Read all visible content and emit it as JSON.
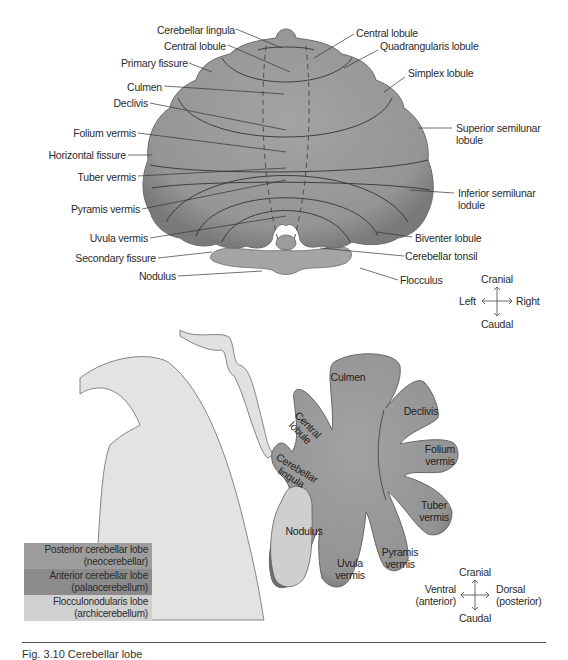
{
  "colors": {
    "cerebellum_fill": "#9a9a9a",
    "cerebellum_shade": "#7c7c7c",
    "brainstem_fill": "#e4e4e4",
    "outline": "#3a3a3a",
    "legend_posterior": "#9d9d9d",
    "legend_anterior": "#8a8a8a",
    "legend_flocculonodular": "#cfcfcf",
    "text": "#2b2b2b"
  },
  "top_view": {
    "labels_left": [
      {
        "text": "Cerebellar lingula"
      },
      {
        "text": "Central lobule"
      },
      {
        "text": "Primary fissure"
      },
      {
        "text": "Culmen"
      },
      {
        "text": "Declivis"
      },
      {
        "text": "Folium vermis"
      },
      {
        "text": "Horizontal fissure"
      },
      {
        "text": "Tuber vermis"
      },
      {
        "text": "Pyramis vermis"
      },
      {
        "text": "Uvula vermis"
      },
      {
        "text": "Secondary fissure"
      },
      {
        "text": "Nodulus"
      }
    ],
    "labels_right": [
      {
        "text": "Central lobule"
      },
      {
        "text": "Quadrangularis lobule"
      },
      {
        "text": "Simplex lobule"
      },
      {
        "text": "Superior semilunar",
        "text2": "lobule"
      },
      {
        "text": "Inferior semilunar",
        "text2": "lodule"
      },
      {
        "text": "Biventer lobule"
      },
      {
        "text": "Cerebellar tonsil"
      },
      {
        "text": "Flocculus"
      }
    ],
    "orientation": {
      "up": "Cranial",
      "down": "Caudal",
      "left": "Left",
      "right": "Right"
    }
  },
  "sagittal_view": {
    "lobes": {
      "culmen": "Culmen",
      "declivis": "Declivis",
      "central_lobule": "Central lobule",
      "cerebellar_lingula": "Cerebellar lingula",
      "folium_vermis_1": "Folium",
      "folium_vermis_2": "vermis",
      "tuber_vermis_1": "Tuber",
      "tuber_vermis_2": "vermis",
      "nodulus": "Nodulus",
      "uvula_vermis_1": "Uvula",
      "uvula_vermis_2": "vermis",
      "pyramis_vermis_1": "Pyramis",
      "pyramis_vermis_2": "vermis"
    },
    "orientation": {
      "up": "Cranial",
      "down": "Caudal",
      "left_1": "Ventral",
      "left_2": "(anterior)",
      "right_1": "Dorsal",
      "right_2": "(posterior)"
    }
  },
  "legend": [
    {
      "line1": "Posterior cerebellar lobe",
      "line2": "(neocerebellar)"
    },
    {
      "line1": "Anterior cerebellar lobe",
      "line2": "(palaocerebellum)"
    },
    {
      "line1": "Flocculonodularis lobe",
      "line2": "(archicerebellum)"
    }
  ],
  "caption": "Fig. 3.10 Cerebellar lobe"
}
